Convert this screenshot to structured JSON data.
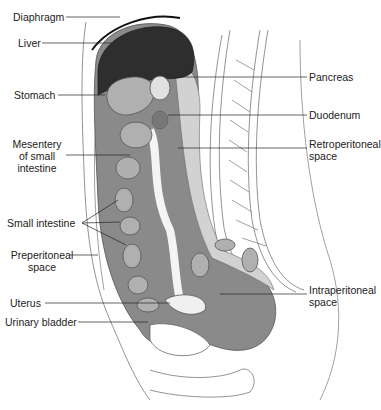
{
  "figure": {
    "colors": {
      "liver": "#2e2e2e",
      "peritoneum_dark": "#8a8a8a",
      "retroperitoneal": "#d2d2d2",
      "organ_fill": "#b0b0b0",
      "outline": "#555555",
      "background": "#ffffff",
      "text": "#222222"
    },
    "labels_left": [
      {
        "id": "diaphragm",
        "text": "Diaphragm"
      },
      {
        "id": "liver",
        "text": "Liver"
      },
      {
        "id": "stomach",
        "text": "Stomach"
      },
      {
        "id": "mesentery",
        "lines": [
          "Mesentery",
          "of small",
          "intestine"
        ]
      },
      {
        "id": "small-intestine",
        "text": "Small intestine"
      },
      {
        "id": "preperitoneal",
        "lines": [
          "Preperitoneal",
          "space"
        ]
      },
      {
        "id": "uterus",
        "text": "Uterus"
      },
      {
        "id": "urinary-bladder",
        "text": "Urinary bladder"
      }
    ],
    "labels_right": [
      {
        "id": "pancreas",
        "text": "Pancreas"
      },
      {
        "id": "duodenum",
        "text": "Duodenum"
      },
      {
        "id": "retroperitoneal",
        "lines": [
          "Retroperitoneal",
          "space"
        ]
      },
      {
        "id": "intraperitoneal",
        "lines": [
          "Intraperitoneal",
          "space"
        ]
      }
    ]
  }
}
